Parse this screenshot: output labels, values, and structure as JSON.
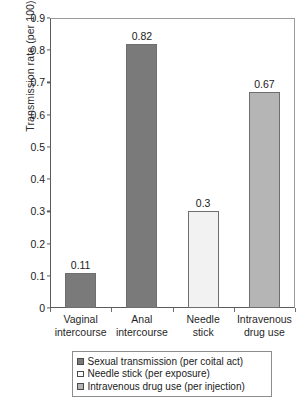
{
  "chart_data": {
    "type": "bar",
    "title": "",
    "xlabel": "",
    "ylabel": "Transmission rate (per 100)",
    "categories": [
      "Vaginal intercourse",
      "Anal intercourse",
      "Needle stick",
      "Intravenous drug use"
    ],
    "category_lines": [
      [
        "Vaginal",
        "intercourse"
      ],
      [
        "Anal",
        "intercourse"
      ],
      [
        "Needle",
        "stick"
      ],
      [
        "Intravenous",
        "drug use"
      ]
    ],
    "values": [
      0.11,
      0.82,
      0.3,
      0.67
    ],
    "value_labels": [
      "0.11",
      "0.82",
      "0.3",
      "0.67"
    ],
    "bar_colors": [
      "#7a7a7a",
      "#7a7a7a",
      "#f2f2f2",
      "#b5b5b5"
    ],
    "bar_series": [
      "Sexual transmission (per coital act)",
      "Sexual transmission (per coital act)",
      "Needle stick (per exposure)",
      "Intravenous drug use (per injection)"
    ],
    "ylim": [
      0,
      0.9
    ],
    "yticks": [
      0,
      0.1,
      0.2,
      0.3,
      0.4,
      0.5,
      0.6,
      0.7,
      0.8,
      0.9
    ],
    "ytick_labels": [
      "0",
      "0.1",
      "0.2",
      "0.3",
      "0.4",
      "0.5",
      "0.6",
      "0.7",
      "0.8",
      "0.9"
    ],
    "grid": false,
    "legend_position": "below-axis",
    "legend": [
      {
        "label": "Sexual transmission (per coital act)",
        "color": "#7a7a7a"
      },
      {
        "label": "Needle stick (per exposure)",
        "color": "#fbfbfb"
      },
      {
        "label": "Intravenous drug use (per injection)",
        "color": "#b5b5b5"
      }
    ],
    "colors": {
      "axis": "#5b5b5b",
      "frame": "#9a9a9a",
      "text": "#1a1a1a",
      "background": "#ffffff"
    }
  }
}
